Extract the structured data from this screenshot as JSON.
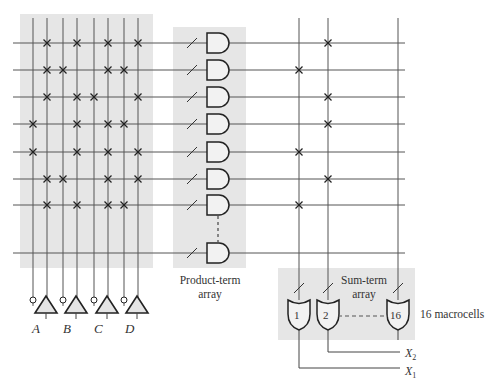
{
  "diagram": {
    "inputs": [
      {
        "label": "A"
      },
      {
        "label": "B"
      },
      {
        "label": "C"
      },
      {
        "label": "D"
      }
    ],
    "input_columns_x": [
      33,
      47,
      63,
      77,
      94,
      108,
      124,
      138
    ],
    "product_rows_y": [
      43,
      70,
      97,
      124,
      152,
      179,
      205,
      253
    ],
    "and_array_connections": [
      [
        1,
        3,
        5,
        7
      ],
      [
        1,
        2,
        5,
        6
      ],
      [
        1,
        3,
        4,
        7
      ],
      [
        0,
        3,
        5,
        6
      ],
      [
        0,
        3,
        5,
        7
      ],
      [
        1,
        2,
        5,
        7
      ],
      [
        1,
        3,
        5,
        6
      ],
      []
    ],
    "sum_columns_x": [
      299,
      328,
      398
    ],
    "or_array_connections": [
      {
        "row": 0,
        "col": 1
      },
      {
        "row": 1,
        "col": 0
      },
      {
        "row": 2,
        "col": 1
      },
      {
        "row": 3,
        "col": 1
      },
      {
        "row": 4,
        "col": 0
      },
      {
        "row": 5,
        "col": 1
      },
      {
        "row": 6,
        "col": 0
      }
    ],
    "product_term_label_line1": "Product-term",
    "product_term_label_line2": "array",
    "sum_term_label_line1": "Sum-term",
    "sum_term_label_line2": "array",
    "or_gates": [
      {
        "label": "1"
      },
      {
        "label": "2"
      },
      {
        "label": "16"
      }
    ],
    "macrocells_label": "16 macrocells",
    "outputs": [
      {
        "label": "X",
        "sub": "2"
      },
      {
        "label": "X",
        "sub": "1"
      }
    ],
    "colors": {
      "shade": "#e6e6e6",
      "line": "#555555",
      "gate_fill": "#f2f2f2",
      "gate_stroke": "#222222"
    }
  }
}
